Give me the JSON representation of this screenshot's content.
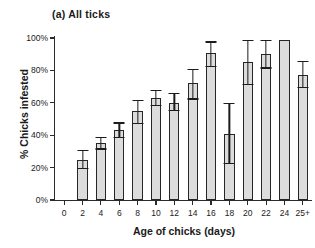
{
  "figure": {
    "panel_title": "(a) All ticks"
  },
  "chart_data": {
    "type": "bar",
    "title": "(a) All ticks",
    "xlabel": "Age of chicks (days)",
    "ylabel": "% Chicks infested",
    "categories": [
      "0",
      "2",
      "4",
      "6",
      "8",
      "10",
      "12",
      "14",
      "16",
      "18",
      "20",
      "22",
      "24",
      "25+"
    ],
    "values": [
      null,
      25,
      35,
      43,
      55,
      63,
      60,
      72,
      91,
      41,
      85,
      90,
      99,
      77
    ],
    "error_low": [
      null,
      19,
      31,
      38,
      47,
      58,
      55,
      62,
      82,
      22,
      71,
      81,
      null,
      69
    ],
    "error_high": [
      null,
      31,
      39,
      48,
      62,
      68,
      66,
      81,
      98,
      60,
      99,
      99,
      null,
      86
    ],
    "ylim": [
      0,
      100
    ],
    "ytick_labels": [
      "0%",
      "20%",
      "40%",
      "60%",
      "80%",
      "100%"
    ],
    "ytick_values": [
      0,
      20,
      40,
      60,
      80,
      100
    ],
    "grid": false,
    "legend": "none",
    "bar_fill_color": "#dcdcdc",
    "bar_edge_color": "#262626",
    "axis_color": "#2b2b2b"
  }
}
